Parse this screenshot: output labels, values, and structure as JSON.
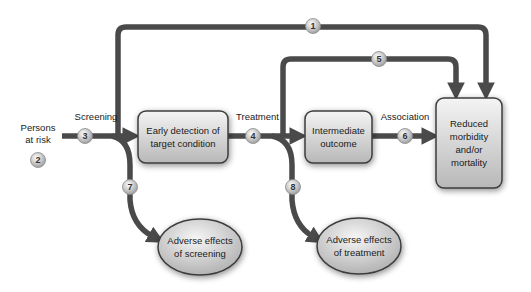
{
  "diagram": {
    "colors": {
      "arrow": "#4a4a4a",
      "box_fill_top": "#f2f2f2",
      "box_fill_bottom": "#bdbdbd",
      "box_stroke": "#3c3c3c",
      "circle_fill": "#cfcfcf",
      "background": "#ffffff"
    },
    "population": {
      "label_line1": "Persons",
      "label_line2": "at risk",
      "marker": "2"
    },
    "steps": {
      "screening": "Screening",
      "treatment": "Treatment",
      "association": "Association"
    },
    "nodes": {
      "early_detection": {
        "line1": "Early detection of",
        "line2": "target condition"
      },
      "intermediate": {
        "line1": "Intermediate",
        "line2": "outcome"
      },
      "reduced": {
        "line1": "Reduced",
        "line2": "morbidity",
        "line3": "and/or",
        "line4": "mortality"
      },
      "adverse_screening": {
        "line1": "Adverse effects",
        "line2": "of screening"
      },
      "adverse_treatment": {
        "line1": "Adverse effects",
        "line2": "of treatment"
      }
    },
    "markers": {
      "m1": "1",
      "m2": "2",
      "m3": "3",
      "m4": "4",
      "m5": "5",
      "m6": "6",
      "m7": "7",
      "m8": "8"
    },
    "links": [
      {
        "id": "1",
        "from": "Persons at risk",
        "to": "Reduced morbidity and/or mortality",
        "type": "overarching"
      },
      {
        "id": "3",
        "from": "Persons at risk",
        "to": "Early detection of target condition",
        "label": "Screening"
      },
      {
        "id": "4",
        "from": "Early detection of target condition",
        "to": "Intermediate outcome",
        "label": "Treatment"
      },
      {
        "id": "5",
        "from": "Early detection of target condition",
        "to": "Reduced morbidity and/or mortality"
      },
      {
        "id": "6",
        "from": "Intermediate outcome",
        "to": "Reduced morbidity and/or mortality",
        "label": "Association"
      },
      {
        "id": "7",
        "from": "Screening",
        "to": "Adverse effects of screening"
      },
      {
        "id": "8",
        "from": "Treatment",
        "to": "Adverse effects of treatment"
      }
    ]
  }
}
